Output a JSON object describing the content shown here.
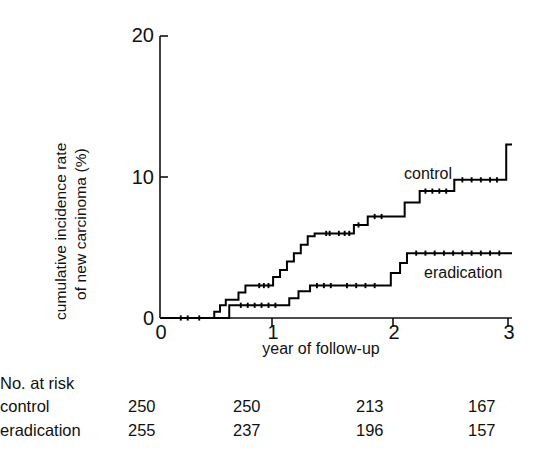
{
  "axes": {
    "y_title_line1": "cumulative incidence rate",
    "y_title_line2": "of new carcinoma (%)",
    "x_title": "year of follow-up",
    "y_ticks": [
      "0",
      "10",
      "20"
    ],
    "x_ticks": [
      "0",
      "1",
      "2",
      "3"
    ]
  },
  "annotations": {
    "control": "control",
    "eradication": "eradication"
  },
  "risk_table": {
    "title": "No. at risk",
    "rows": [
      {
        "label": "control",
        "values": [
          "250",
          "250",
          "213",
          "167"
        ]
      },
      {
        "label": "eradication",
        "values": [
          "255",
          "237",
          "196",
          "157"
        ]
      }
    ]
  },
  "chart_data": {
    "type": "line",
    "title": "",
    "xlabel": "year of follow-up",
    "ylabel": "cumulative incidence rate of new carcinoma (%)",
    "xlim": [
      0,
      3.05
    ],
    "ylim": [
      0,
      20
    ],
    "xticks": [
      0,
      1,
      2,
      3
    ],
    "yticks": [
      0,
      10,
      20
    ],
    "grid": false,
    "legend": "inline-annotations",
    "interpolation": "step-post",
    "series": [
      {
        "name": "control",
        "color": "#000000",
        "x": [
          0,
          0.4,
          0.47,
          0.52,
          0.57,
          0.62,
          0.68,
          0.74,
          0.8,
          0.98,
          1.04,
          1.1,
          1.16,
          1.22,
          1.28,
          1.34,
          1.4,
          1.5,
          1.68,
          1.8,
          2.0,
          2.12,
          2.25,
          2.55,
          2.96,
          3.0
        ],
        "y": [
          0,
          0.0,
          0.45,
          0.9,
          1.3,
          1.3,
          1.8,
          2.3,
          2.3,
          2.9,
          3.4,
          4.0,
          4.6,
          5.2,
          5.8,
          6.0,
          6.0,
          6.0,
          6.6,
          7.2,
          7.2,
          8.2,
          9.0,
          9.8,
          9.8,
          12.3
        ]
      },
      {
        "name": "eradication",
        "color": "#000000",
        "x": [
          0,
          0.4,
          0.55,
          0.6,
          1.05,
          1.12,
          1.2,
          1.3,
          1.55,
          1.92,
          2.0,
          2.08,
          2.14,
          3.0
        ],
        "y": [
          0,
          0.0,
          0.0,
          0.9,
          0.9,
          1.4,
          1.9,
          2.3,
          2.3,
          2.3,
          3.2,
          3.9,
          4.6,
          4.6
        ]
      }
    ],
    "censor_marks": {
      "control": [
        0.18,
        0.24,
        0.34,
        0.86,
        0.9,
        0.94,
        1.44,
        1.47,
        1.55,
        1.6,
        1.64,
        1.72,
        1.86,
        1.92,
        2.3,
        2.36,
        2.42,
        2.48,
        2.62,
        2.7,
        2.78,
        2.86,
        2.92
      ],
      "eradication": [
        0.7,
        0.76,
        0.82,
        0.88,
        0.94,
        1.0,
        1.36,
        1.42,
        1.48,
        1.62,
        1.7,
        1.78,
        1.86,
        2.22,
        2.3,
        2.38,
        2.46,
        2.54,
        2.62,
        2.7,
        2.78,
        2.86,
        2.94
      ]
    }
  }
}
